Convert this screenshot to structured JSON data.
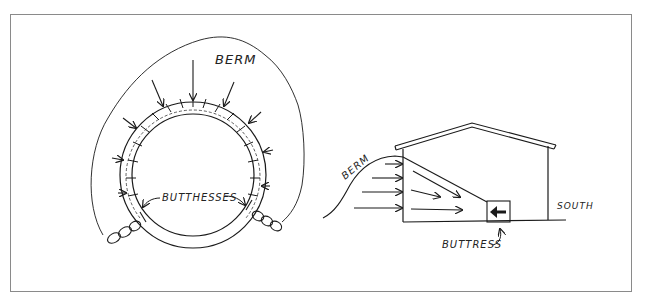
{
  "figure": {
    "left_diagram": {
      "title": "plan-view-circular-wall",
      "labels": {
        "berm": "BERM",
        "buttresses": "BUTTHESSES"
      }
    },
    "right_diagram": {
      "title": "section-view-bermed-building",
      "labels": {
        "berm": "BERM",
        "buttress": "BUTTRESS",
        "south": "SOUTH"
      }
    },
    "colors": {
      "ink": "#1a1a1a",
      "frame": "#8a8a8a",
      "background": "#ffffff"
    }
  }
}
